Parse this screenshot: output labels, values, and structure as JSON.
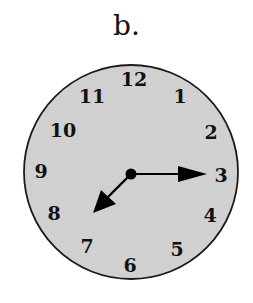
{
  "label": "b.",
  "clock": {
    "time": "7:15",
    "hour_hand_points_to": "between 7 and 8",
    "minute_hand_points_to": 3,
    "numerals": [
      {
        "text": "12",
        "x": 134,
        "y": 86
      },
      {
        "text": "1",
        "x": 180,
        "y": 103
      },
      {
        "text": "2",
        "x": 211,
        "y": 139
      },
      {
        "text": "3",
        "x": 221,
        "y": 182
      },
      {
        "text": "4",
        "x": 210,
        "y": 222
      },
      {
        "text": "5",
        "x": 177,
        "y": 256
      },
      {
        "text": "6",
        "x": 130,
        "y": 272
      },
      {
        "text": "7",
        "x": 87,
        "y": 253
      },
      {
        "text": "8",
        "x": 54,
        "y": 220
      },
      {
        "text": "9",
        "x": 41,
        "y": 178
      },
      {
        "text": "10",
        "x": 63,
        "y": 137
      },
      {
        "text": "11",
        "x": 92,
        "y": 103
      }
    ],
    "colors": {
      "face": "#cfcfcf",
      "rim": "#1a1a1a",
      "hands": "#000000"
    }
  }
}
